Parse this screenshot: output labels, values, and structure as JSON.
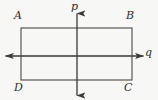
{
  "figure": {
    "kind": "coordinate-diagram",
    "background_color": "#f7f7f5",
    "stroke_color": "#3a3a3a",
    "label_color": "#2e2e2e"
  },
  "axes": {
    "vertical": {
      "name": "p",
      "label": "p",
      "orientation": "vertical",
      "arrowheads": "both",
      "x": 77,
      "y_start": 12,
      "y_end": 97
    },
    "horizontal": {
      "name": "q",
      "label": "q",
      "orientation": "horizontal",
      "arrowheads": "both",
      "y": 56,
      "x_start": 4,
      "x_end": 145
    }
  },
  "rectangle": {
    "name": "ABCD",
    "left": 21,
    "right": 132,
    "top": 28,
    "bottom": 80,
    "vertices": [
      {
        "label": "A",
        "position": "top-left"
      },
      {
        "label": "B",
        "position": "top-right"
      },
      {
        "label": "C",
        "position": "bottom-right"
      },
      {
        "label": "D",
        "position": "bottom-left"
      }
    ]
  }
}
